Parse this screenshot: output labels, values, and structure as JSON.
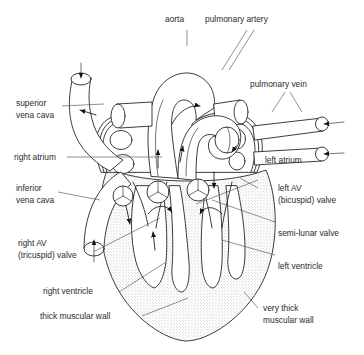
{
  "diagram": {
    "background_color": "#ffffff",
    "line_color": "#1a1a1a",
    "leader_color": "#555555",
    "muscle_fill": "stippled-grey"
  },
  "labels": {
    "aorta": "aorta",
    "pulmonary_artery": "pulmonary artery",
    "pulmonary_vein": "pulmonary vein",
    "superior_vena_cava_l1": "superior",
    "superior_vena_cava_l2": "vena cava",
    "inferior_vena_cava_l1": "inferior",
    "inferior_vena_cava_l2": "vena cava",
    "right_atrium": "right atrium",
    "left_atrium": "left atrium",
    "right_av_valve_l1": "right AV",
    "right_av_valve_l2": "(tricuspid) valve",
    "left_av_valve_l1": "left AV",
    "left_av_valve_l2": "(bicuspid) valve",
    "semi_lunar_valve": "semi-lunar valve",
    "right_ventricle": "right ventricle",
    "left_ventricle": "left ventricle",
    "thick_muscular_wall": "thick muscular wall",
    "very_thick_wall_l1": "very thick",
    "very_thick_wall_l2": "muscular wall"
  }
}
